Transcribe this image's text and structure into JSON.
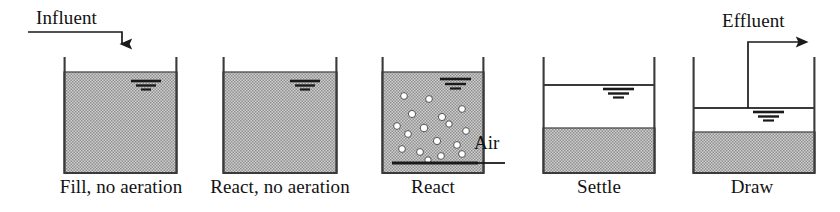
{
  "figure": {
    "background_color": "#ffffff",
    "ink_color": "#1a1a1a",
    "sludge_fill_color": "#a8a8a8",
    "clear_water_color": "#ffffff"
  },
  "flow_labels": {
    "influent": "Influent",
    "effluent": "Effluent"
  },
  "annotations": {
    "air": "Air"
  },
  "stages": [
    {
      "id": "fill",
      "label": "Fill, no aeration",
      "label_center_x": 121,
      "label_y": 178,
      "tank": {
        "x": 64,
        "y": 58,
        "width": 113,
        "height": 115
      },
      "mixed_liquor_top": 72,
      "clear_water_top": null,
      "has_bubbles": false,
      "has_air_diffuser": false,
      "surface_marker_x": 146,
      "surface_marker_y": 82
    },
    {
      "id": "react-no-aeration",
      "label": "React, no aeration",
      "label_center_x": 280,
      "label_y": 178,
      "tank": {
        "x": 223,
        "y": 58,
        "width": 114,
        "height": 115
      },
      "mixed_liquor_top": 72,
      "clear_water_top": null,
      "has_bubbles": false,
      "has_air_diffuser": false,
      "surface_marker_x": 305,
      "surface_marker_y": 82
    },
    {
      "id": "react",
      "label": "React",
      "label_center_x": 433,
      "label_y": 178,
      "tank": {
        "x": 382,
        "y": 58,
        "width": 102,
        "height": 115
      },
      "mixed_liquor_top": 72,
      "clear_water_top": null,
      "has_bubbles": true,
      "has_air_diffuser": true,
      "surface_marker_x": 455,
      "surface_marker_y": 82,
      "bubbles": [
        {
          "x": 404,
          "y": 96
        },
        {
          "x": 429,
          "y": 99
        },
        {
          "x": 412,
          "y": 114
        },
        {
          "x": 442,
          "y": 117
        },
        {
          "x": 462,
          "y": 109
        },
        {
          "x": 397,
          "y": 126
        },
        {
          "x": 424,
          "y": 128
        },
        {
          "x": 449,
          "y": 124
        },
        {
          "x": 466,
          "y": 131
        },
        {
          "x": 408,
          "y": 134
        },
        {
          "x": 437,
          "y": 141
        },
        {
          "x": 457,
          "y": 145
        },
        {
          "x": 402,
          "y": 149
        },
        {
          "x": 420,
          "y": 152
        },
        {
          "x": 441,
          "y": 156
        },
        {
          "x": 462,
          "y": 154
        },
        {
          "x": 428,
          "y": 160
        }
      ],
      "diffuser": {
        "x1": 392,
        "x2": 478,
        "y": 163
      },
      "air_line": {
        "x1": 478,
        "x2": 505,
        "y": 163
      },
      "air_label_x": 474,
      "air_label_y": 136
    },
    {
      "id": "settle",
      "label": "Settle",
      "label_center_x": 599,
      "label_y": 178,
      "tank": {
        "x": 543,
        "y": 58,
        "width": 112,
        "height": 115
      },
      "mixed_liquor_top": 128,
      "clear_water_top": 85,
      "has_bubbles": false,
      "has_air_diffuser": false,
      "surface_marker_x": 618,
      "surface_marker_y": 92
    },
    {
      "id": "draw",
      "label": "Draw",
      "label_center_x": 752,
      "label_y": 178,
      "tank": {
        "x": 693,
        "y": 58,
        "width": 122,
        "height": 115
      },
      "mixed_liquor_top": 132,
      "clear_water_top": 108,
      "has_bubbles": false,
      "has_air_diffuser": false,
      "surface_marker_x": 768,
      "surface_marker_y": 115
    }
  ],
  "influent_arrow": {
    "start_x": 28,
    "horizontal_y": 32,
    "corner_x": 122,
    "tip_y": 54,
    "label_x": 36,
    "label_y": 10
  },
  "effluent_arrow": {
    "pipe_x": 748,
    "pipe_bottom_y": 108,
    "horizontal_y": 42,
    "tip_x": 817,
    "label_x": 722,
    "label_y": 14
  }
}
